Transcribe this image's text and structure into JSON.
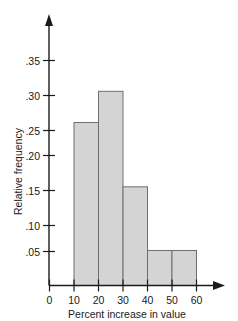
{
  "chart_data": {
    "type": "bar",
    "title": "",
    "subtitle": "",
    "xlabel": "Percent increase in value",
    "ylabel": "Relative frequency",
    "categories": [
      "0-10",
      "10-20",
      "20-30",
      "30-40",
      "40-50",
      "50-60"
    ],
    "bin_edges": [
      0,
      10,
      20,
      30,
      40,
      50,
      60
    ],
    "values": [
      0.205,
      0.256,
      0.305,
      0.155,
      0.055,
      0.055
    ],
    "x": [
      0,
      10,
      20,
      30,
      40,
      50,
      60
    ],
    "xlim": [
      0,
      60
    ],
    "ylim": [
      0,
      0.3875
    ],
    "xticks": [
      0,
      10,
      20,
      30,
      40,
      50,
      60
    ],
    "xtick_labels": [
      "0",
      "10",
      "20",
      "30",
      "40",
      "50",
      "60"
    ],
    "yticks": [
      0.05,
      0.1,
      0.15,
      0.2,
      0.25,
      0.3,
      0.35
    ],
    "ytick_labels": [
      ".05",
      ".10",
      ".15",
      ".20",
      ".25",
      ".30",
      ".35"
    ],
    "grid": false,
    "legend": null,
    "legend_position": "none",
    "annotations": [],
    "colors": {
      "bar_fill": "#d4d4d4",
      "bar_stroke": "#6e6e6e",
      "axis": "#1a1a1a",
      "text": "#1a1a1a",
      "background": "#ffffff"
    }
  },
  "axes": {
    "x_title": "Percent increase in value",
    "y_title": "Relative frequency",
    "x_ticks": [
      "0",
      "10",
      "20",
      "30",
      "40",
      "50",
      "60"
    ],
    "y_ticks": [
      ".35",
      ".30",
      ".25",
      ".20",
      ".15",
      ".10",
      ".05"
    ]
  }
}
